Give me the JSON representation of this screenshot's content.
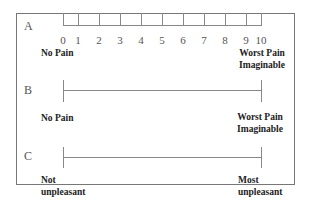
{
  "scales": [
    {
      "letter": "A",
      "left_label": "No Pain",
      "right_label_1": "Worst Pain",
      "right_label_2": "Imaginable",
      "ticks": [
        "0",
        "1",
        "2",
        "3",
        "4",
        "5",
        "6",
        "7",
        "8",
        "9",
        "10"
      ]
    },
    {
      "letter": "B",
      "left_label": "No Pain",
      "right_label_1": "Worst Pain",
      "right_label_2": "Imaginable"
    },
    {
      "letter": "C",
      "left_label_1": "Not",
      "left_label_2": "unpleasant",
      "right_label_1": "Most",
      "right_label_2": "unpleasant"
    }
  ]
}
